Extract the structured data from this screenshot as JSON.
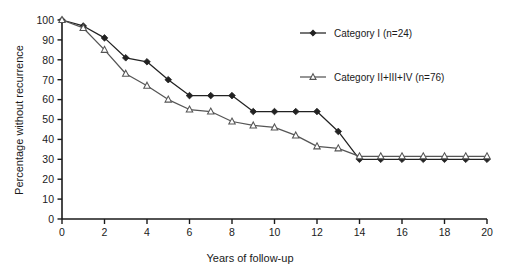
{
  "chart_data": {
    "type": "line",
    "title": "",
    "subtitle": "",
    "xlabel": "Years of follow-up",
    "ylabel": "Percentage without recurrence",
    "xlim": [
      0,
      20
    ],
    "ylim": [
      0,
      100
    ],
    "xticks": [
      0,
      2,
      4,
      6,
      8,
      10,
      12,
      14,
      16,
      18,
      20
    ],
    "xtick_labels": [
      "0",
      "2",
      "4",
      "6",
      "8",
      "10",
      "12",
      "14",
      "16",
      "18",
      "20"
    ],
    "yticks": [
      0,
      10,
      20,
      30,
      40,
      50,
      60,
      70,
      80,
      90,
      100
    ],
    "ytick_labels": [
      "0",
      "10",
      "20",
      "30",
      "40",
      "50",
      "60",
      "70",
      "80",
      "90",
      "100"
    ],
    "grid": false,
    "legend_position": "top-right",
    "x": [
      0,
      1,
      2,
      3,
      4,
      5,
      6,
      7,
      8,
      9,
      10,
      11,
      12,
      13,
      14,
      15,
      16,
      17,
      18,
      19,
      20
    ],
    "series": [
      {
        "name": "Category I (n=24)",
        "marker": "filled-diamond",
        "color": "#222222",
        "values": [
          100,
          97,
          91,
          81,
          79,
          70,
          62,
          62,
          62,
          54,
          54,
          54,
          54,
          44,
          30,
          30,
          30,
          30,
          30,
          30,
          30
        ]
      },
      {
        "name": "Category II+III+IV (n=76)",
        "marker": "open-triangle",
        "color": "#555555",
        "values": [
          100,
          96,
          85,
          73,
          67,
          60,
          55,
          54,
          49,
          47,
          46,
          42,
          36.5,
          35.5,
          31.5,
          31.5,
          31.5,
          31.5,
          31.5,
          31.5,
          31.5
        ]
      }
    ]
  },
  "legend": {
    "entries": [
      {
        "label": "Category I (n=24)",
        "marker": "filled-diamond"
      },
      {
        "label": "Category II+III+IV (n=76)",
        "marker": "open-triangle"
      }
    ]
  },
  "axes": {
    "x_title": "Years of follow-up",
    "y_title": "Percentage without recurrence"
  },
  "colors": {
    "axis": "#1a1a1a",
    "series_1": "#222222",
    "series_2": "#555555",
    "background": "#ffffff"
  }
}
